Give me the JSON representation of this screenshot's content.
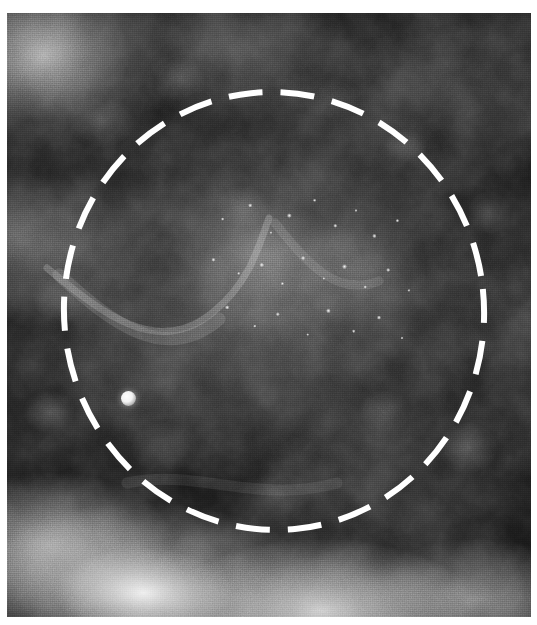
{
  "viewer": {
    "title": "Mammogram region-of-interest view",
    "modality": "Mammography",
    "image_kind": "grayscale radiograph",
    "canvas_width": 537,
    "canvas_height": 625,
    "border_color": "#ffffff"
  },
  "plate": {
    "name": "radiograph-plate",
    "left": 7,
    "top": 13,
    "width": 524,
    "height": 604,
    "background_color": "#111111",
    "description": "Dark mottled breast parenchyma with brighter fibroglandular tissue toward the lower and left margins"
  },
  "annotations": {
    "roi_circle": {
      "label": "dashed-circle-annotation",
      "shape": "circle",
      "stroke_color": "#ffffff",
      "stroke_width": 6,
      "dash_length": 34,
      "gap_length": 18,
      "center_x": 274,
      "center_y": 311,
      "radius_x": 210,
      "radius_y": 219
    },
    "calcification_cluster": {
      "label": "microcalcification-cluster",
      "center_x": 310,
      "center_y": 270,
      "width": 230,
      "height": 170,
      "appearance": "pleomorphic punctate bright specks"
    },
    "solitary_calcification": {
      "label": "solitary-calcification",
      "center_x": 128,
      "center_y": 398,
      "diameter": 15,
      "appearance": "single dense round bright opacity"
    }
  },
  "grayscale": {
    "black_point": "#000000",
    "dark_tissue": "#151515",
    "mid_tissue": "#6e6e6e",
    "bright_tissue": "#d8d8d8",
    "white_point": "#ffffff"
  }
}
